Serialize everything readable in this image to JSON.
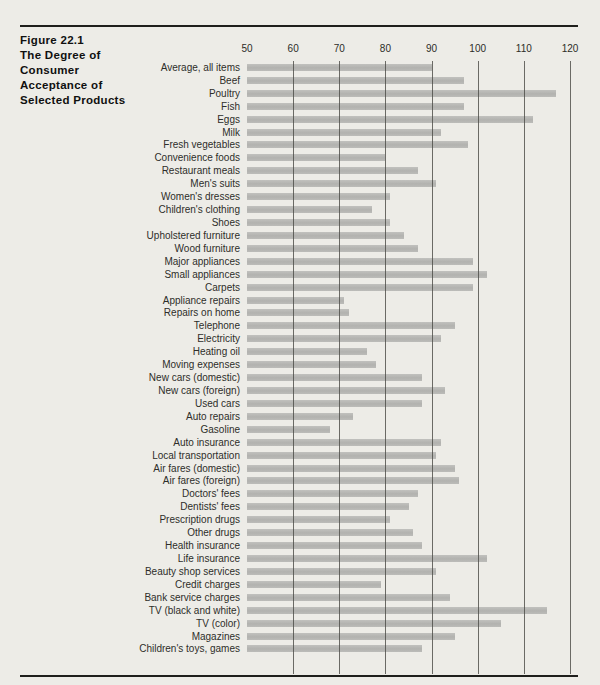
{
  "figure": {
    "title_lines": [
      "Figure 22.1",
      "The Degree of",
      "Consumer",
      "Acceptance of",
      "Selected Products"
    ]
  },
  "colors": {
    "paper": "#edece7",
    "bar": "#b7b7b4",
    "gridline": "#4a4a45",
    "rule": "#1f1f1c",
    "text": "#22221f"
  },
  "chart_data": {
    "type": "bar",
    "orientation": "horizontal",
    "title": "Figure 22.1 The Degree of Consumer Acceptance of Selected Products",
    "xlabel": "",
    "ylabel": "",
    "xlim": [
      50,
      120
    ],
    "xticks": [
      50,
      60,
      70,
      80,
      90,
      100,
      110,
      120
    ],
    "grid": "vertical gridlines at 60,70,80,90,100,110,120",
    "legend": "none",
    "categories": [
      "Average, all items",
      "Beef",
      "Poultry",
      "Fish",
      "Eggs",
      "Milk",
      "Fresh vegetables",
      "Convenience foods",
      "Restaurant meals",
      "Men's suits",
      "Women's dresses",
      "Children's clothing",
      "Shoes",
      "Upholstered furniture",
      "Wood furniture",
      "Major appliances",
      "Small appliances",
      "Carpets",
      "Appliance repairs",
      "Repairs on home",
      "Telephone",
      "Electricity",
      "Heating oil",
      "Moving expenses",
      "New cars (domestic)",
      "New cars (foreign)",
      "Used cars",
      "Auto repairs",
      "Gasoline",
      "Auto insurance",
      "Local transportation",
      "Air fares (domestic)",
      "Air fares (foreign)",
      "Doctors' fees",
      "Dentists' fees",
      "Prescription drugs",
      "Other drugs",
      "Health insurance",
      "Life insurance",
      "Beauty shop services",
      "Credit charges",
      "Bank service charges",
      "TV (black and white)",
      "TV (color)",
      "Magazines",
      "Children's toys, games"
    ],
    "values": [
      90,
      97,
      117,
      97,
      112,
      92,
      98,
      80,
      87,
      91,
      81,
      77,
      81,
      84,
      87,
      99,
      102,
      99,
      71,
      72,
      95,
      92,
      76,
      78,
      88,
      93,
      88,
      73,
      68,
      92,
      91,
      95,
      96,
      87,
      85,
      81,
      86,
      88,
      102,
      91,
      79,
      94,
      115,
      105,
      95,
      88
    ]
  }
}
